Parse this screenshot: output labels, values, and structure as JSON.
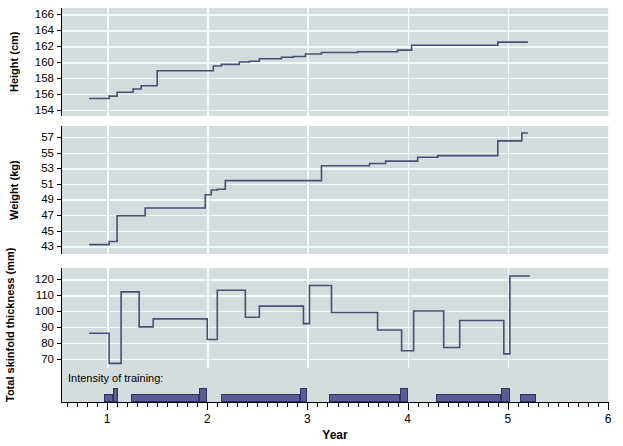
{
  "chart_data": {
    "type": "line",
    "title": "",
    "xlabel": "Year",
    "xlim": [
      0.55,
      6.0
    ],
    "xticks_major": [
      1,
      2,
      3,
      4,
      5,
      6
    ],
    "xtick_labels": [
      "1",
      "2",
      "3",
      "4",
      "5",
      "6"
    ],
    "xtick_minor_step": 0.1,
    "grid": true,
    "legend": "none",
    "annotations": [
      "Intensity of training:"
    ],
    "panels": [
      {
        "name": "height",
        "ylabel": "Height (cm)",
        "ylim": [
          153.2,
          166.8
        ],
        "yticks": [
          154,
          156,
          158,
          160,
          162,
          164,
          166
        ],
        "step": "post",
        "x": [
          0.82,
          0.95,
          1.02,
          1.1,
          1.18,
          1.26,
          1.34,
          1.5,
          1.66,
          1.82,
          1.98,
          2.06,
          2.14,
          2.22,
          2.32,
          2.42,
          2.52,
          2.62,
          2.74,
          2.86,
          2.98,
          3.14,
          3.3,
          3.5,
          3.7,
          3.9,
          4.04,
          4.3,
          4.6,
          4.9,
          5.02,
          5.2
        ],
        "y": [
          155.4,
          155.4,
          155.7,
          156.2,
          156.2,
          156.6,
          157.0,
          158.9,
          158.9,
          158.9,
          158.9,
          159.5,
          159.7,
          159.7,
          160.0,
          160.1,
          160.4,
          160.4,
          160.6,
          160.7,
          161.0,
          161.2,
          161.2,
          161.3,
          161.3,
          161.5,
          162.1,
          162.1,
          162.1,
          162.5,
          162.5,
          162.5
        ]
      },
      {
        "name": "weight",
        "ylabel": "Weight (kg)",
        "ylim": [
          42.0,
          58.4
        ],
        "yticks": [
          43,
          45,
          47,
          49,
          51,
          53,
          55,
          57
        ],
        "step": "post",
        "x": [
          0.82,
          0.95,
          1.02,
          1.1,
          1.22,
          1.38,
          1.54,
          1.7,
          1.86,
          1.98,
          2.04,
          2.1,
          2.18,
          2.28,
          2.4,
          2.52,
          2.66,
          2.82,
          2.98,
          3.14,
          3.3,
          3.46,
          3.62,
          3.78,
          3.94,
          4.1,
          4.3,
          4.5,
          4.7,
          4.9,
          5.02,
          5.14,
          5.2
        ],
        "y": [
          43.2,
          43.2,
          43.6,
          46.9,
          46.9,
          47.9,
          47.9,
          47.9,
          47.9,
          49.6,
          50.2,
          50.3,
          51.4,
          51.4,
          51.4,
          51.4,
          51.4,
          51.4,
          51.4,
          53.3,
          53.3,
          53.3,
          53.6,
          53.9,
          53.9,
          54.4,
          54.6,
          54.6,
          54.6,
          56.5,
          56.5,
          57.5,
          57.5
        ]
      },
      {
        "name": "skinfold",
        "ylabel": "Total skinfold thickness (mm)",
        "ylim": [
          44.0,
          127.0
        ],
        "yticks": [
          70,
          80,
          90,
          100,
          110,
          120
        ],
        "step": "post",
        "x": [
          0.82,
          0.95,
          1.02,
          1.14,
          1.24,
          1.32,
          1.46,
          1.94,
          2.0,
          2.1,
          2.22,
          2.38,
          2.52,
          2.7,
          2.86,
          2.96,
          3.02,
          3.12,
          3.24,
          3.56,
          3.7,
          3.84,
          3.94,
          4.06,
          4.2,
          4.36,
          4.52,
          4.7,
          4.96,
          5.02,
          5.22
        ],
        "y": [
          86.0,
          86.0,
          67.0,
          112.0,
          112.0,
          90.0,
          95.0,
          95.0,
          82.0,
          113.0,
          113.0,
          96.0,
          103.0,
          103.0,
          103.0,
          92.0,
          116.0,
          116.0,
          99.0,
          99.0,
          88.0,
          88.0,
          75.0,
          100.0,
          100.0,
          77.0,
          94.0,
          94.0,
          73.0,
          122.0,
          122.0
        ]
      }
    ],
    "intensity_bars": [
      {
        "x0": 0.97,
        "x1": 1.06,
        "level": 1
      },
      {
        "x0": 1.06,
        "x1": 1.11,
        "level": 2
      },
      {
        "x0": 1.24,
        "x1": 1.92,
        "level": 1
      },
      {
        "x0": 1.92,
        "x1": 2.0,
        "level": 2
      },
      {
        "x0": 2.14,
        "x1": 2.93,
        "level": 1
      },
      {
        "x0": 2.93,
        "x1": 3.0,
        "level": 2
      },
      {
        "x0": 3.22,
        "x1": 3.92,
        "level": 1
      },
      {
        "x0": 3.92,
        "x1": 4.0,
        "level": 2
      },
      {
        "x0": 4.28,
        "x1": 4.93,
        "level": 1
      },
      {
        "x0": 4.93,
        "x1": 5.02,
        "level": 2
      },
      {
        "x0": 5.12,
        "x1": 5.28,
        "level": 1
      }
    ]
  },
  "style": {
    "panel_bg": "#d4dcdd",
    "grid_color": "#f4f8f8",
    "line_color": "#4a4f74",
    "bar_fill": "#5b5c91",
    "bar_stroke": "#32326b",
    "axis_color": "#000000",
    "page_bg": "#ffffff"
  }
}
